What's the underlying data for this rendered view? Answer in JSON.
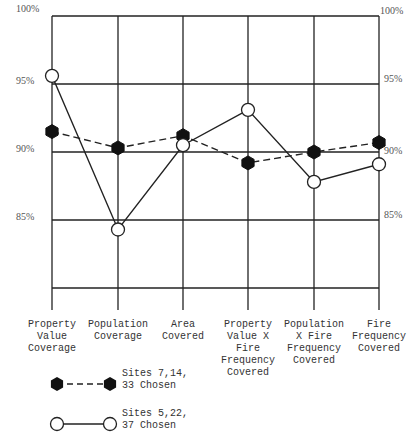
{
  "chart_data": {
    "type": "line",
    "title": "",
    "xlabel": "",
    "ylabel": "",
    "ylim": [
      80,
      100
    ],
    "yticks": [
      "100%",
      "95%",
      "90%",
      "85%"
    ],
    "grid": true,
    "categories": [
      "Property\nValue\nCoverage",
      "Population\nCoverage",
      "Area\nCovered",
      "Property\nValue X\nFire\nFrequency\nCovered",
      "Population\nX Fire\nFrequency\nCovered",
      "Fire\nFrequency\nCovered"
    ],
    "series": [
      {
        "name": "Sites 7,14, 33 Chosen",
        "marker": "filled-hexagon",
        "line": "dashed",
        "values": [
          91.5,
          90.3,
          91.2,
          89.2,
          90.0,
          90.7
        ]
      },
      {
        "name": "Sites 5,22, 37 Chosen",
        "marker": "open-circle",
        "line": "solid",
        "values": [
          95.6,
          84.3,
          90.5,
          93.1,
          87.8,
          89.1
        ]
      }
    ],
    "legend_position": "bottom-left"
  },
  "axis": {
    "left_ticks": [
      "100%",
      "95%",
      "90%",
      "85%"
    ],
    "right_ticks": [
      "100%",
      "95%",
      "90%",
      "85%"
    ]
  },
  "categories": [
    "Property\nValue\nCoverage",
    "Population\nCoverage",
    "Area\nCovered",
    "Property\nValue X\nFire\nFrequency\nCovered",
    "Population\nX Fire\nFrequency\nCovered",
    "Fire\nFrequency\nCovered"
  ],
  "legend": {
    "series_a": "Sites 7,14,\n 33 Chosen",
    "series_b": "Sites 5,22,\n 37 Chosen"
  }
}
